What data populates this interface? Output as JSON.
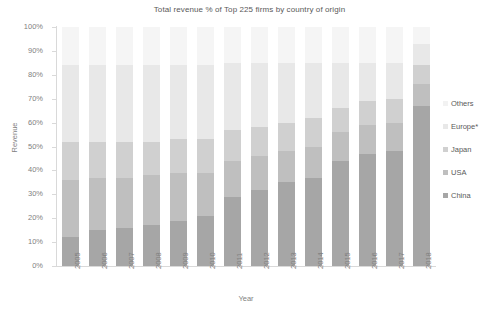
{
  "chart_data": {
    "type": "bar",
    "subtype": "stacked-100-percent-column",
    "title": "Total revenue % of Top 225 firms by country of origin",
    "xlabel": "Year",
    "ylabel": "Revenue",
    "categories": [
      "2005",
      "2006",
      "2007",
      "2008",
      "2009",
      "2010",
      "2011",
      "2012",
      "2013",
      "2014",
      "2015",
      "2016",
      "2017",
      "2018"
    ],
    "ylim": [
      0,
      100
    ],
    "ytick_labels": [
      "0%",
      "10%",
      "20%",
      "30%",
      "40%",
      "50%",
      "60%",
      "70%",
      "80%",
      "90%",
      "100%"
    ],
    "ytick_values": [
      0,
      10,
      20,
      30,
      40,
      50,
      60,
      70,
      80,
      90,
      100
    ],
    "grid": false,
    "legend_position": "right",
    "stack_order_bottom_to_top": [
      "China",
      "USA",
      "Japan",
      "Europe*",
      "Others"
    ],
    "series": [
      {
        "name": "China",
        "color": "#a6a6a6",
        "values": [
          12,
          15,
          16,
          17,
          19,
          21,
          29,
          32,
          35,
          37,
          44,
          47,
          48,
          67
        ]
      },
      {
        "name": "USA",
        "color": "#bfbfbf",
        "values": [
          24,
          22,
          21,
          21,
          20,
          18,
          15,
          14,
          13,
          13,
          12,
          12,
          12,
          9
        ]
      },
      {
        "name": "Japan",
        "color": "#d0d0d0",
        "values": [
          16,
          15,
          15,
          14,
          14,
          14,
          13,
          12,
          12,
          12,
          10,
          10,
          10,
          8
        ]
      },
      {
        "name": "Europe*",
        "color": "#e8e8e8",
        "values": [
          32,
          32,
          32,
          32,
          31,
          31,
          28,
          27,
          25,
          23,
          19,
          16,
          15,
          9
        ]
      },
      {
        "name": "Others",
        "color": "#f5f5f5",
        "values": [
          16,
          16,
          16,
          16,
          16,
          16,
          15,
          15,
          15,
          15,
          15,
          15,
          15,
          7
        ]
      }
    ]
  },
  "legend": {
    "items": [
      {
        "label": "Others",
        "color": "#f2f2f2"
      },
      {
        "label": "Europe*",
        "color": "#e8e8e8"
      },
      {
        "label": "Japan",
        "color": "#d0d0d0"
      },
      {
        "label": "USA",
        "color": "#bfbfbf"
      },
      {
        "label": "China",
        "color": "#a6a6a6"
      }
    ]
  },
  "colors": {
    "axis": "#d9d9d9",
    "text": "#595959",
    "tick_text": "#7f7f7f",
    "background": "#ffffff"
  }
}
